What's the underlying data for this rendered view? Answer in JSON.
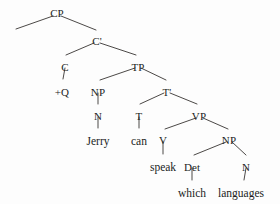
{
  "figure": {
    "kind": "syntax-tree",
    "background_color": "#fdfdfd",
    "ink_color": "#231f1e",
    "width": 280,
    "height": 204
  },
  "nodes": [
    {
      "id": "cp",
      "label": "CP",
      "x": 57,
      "y": 8,
      "type": "nonterminal"
    },
    {
      "id": "spec-cp",
      "label": "",
      "x": 16,
      "y": 29,
      "type": "empty-specifier"
    },
    {
      "id": "cbar",
      "label": "C'",
      "x": 97,
      "y": 36,
      "type": "nonterminal"
    },
    {
      "id": "c",
      "label": "C",
      "x": 65,
      "y": 62,
      "type": "nonterminal"
    },
    {
      "id": "q",
      "label": "+Q",
      "x": 62,
      "y": 87,
      "type": "feature"
    },
    {
      "id": "tp",
      "label": "TP",
      "x": 138,
      "y": 62,
      "type": "nonterminal"
    },
    {
      "id": "np-subj",
      "label": "NP",
      "x": 98,
      "y": 87,
      "type": "nonterminal"
    },
    {
      "id": "n-subj",
      "label": "N",
      "x": 98,
      "y": 111,
      "type": "nonterminal"
    },
    {
      "id": "tbar",
      "label": "T'",
      "x": 167,
      "y": 87,
      "type": "nonterminal"
    },
    {
      "id": "t",
      "label": "T",
      "x": 139,
      "y": 111,
      "type": "nonterminal"
    },
    {
      "id": "vp",
      "label": "VP",
      "x": 199,
      "y": 111,
      "type": "nonterminal"
    },
    {
      "id": "v",
      "label": "V",
      "x": 163,
      "y": 135,
      "type": "nonterminal"
    },
    {
      "id": "np-obj",
      "label": "NP",
      "x": 229,
      "y": 135,
      "type": "nonterminal"
    },
    {
      "id": "det",
      "label": "Det",
      "x": 192,
      "y": 162,
      "type": "nonterminal"
    },
    {
      "id": "n-obj",
      "label": "N",
      "x": 246,
      "y": 162,
      "type": "nonterminal"
    }
  ],
  "terminals": [
    {
      "id": "jerry",
      "label": "Jerry",
      "x": 98,
      "y": 136
    },
    {
      "id": "can",
      "label": "can",
      "x": 139,
      "y": 136
    },
    {
      "id": "speak",
      "label": "speak",
      "x": 163,
      "y": 162
    },
    {
      "id": "which",
      "label": "which",
      "x": 192,
      "y": 188
    },
    {
      "id": "languages",
      "label": "languages",
      "x": 241,
      "y": 188
    }
  ],
  "edges": [
    {
      "id": "cp-spec",
      "from": "cp",
      "to": "spec-cp",
      "x1": 53,
      "y1": 16,
      "x2": 16,
      "y2": 29
    },
    {
      "id": "cp-cbar",
      "from": "cp",
      "to": "cbar",
      "x1": 61,
      "y1": 16,
      "x2": 96,
      "y2": 30
    },
    {
      "id": "cbar-c",
      "from": "cbar",
      "to": "c",
      "x1": 94,
      "y1": 43,
      "x2": 66,
      "y2": 55
    },
    {
      "id": "cbar-tp",
      "from": "cbar",
      "to": "tp",
      "x1": 100,
      "y1": 43,
      "x2": 136,
      "y2": 55
    },
    {
      "id": "c-q",
      "from": "c",
      "to": "q",
      "x1": 65,
      "y1": 68,
      "x2": 63,
      "y2": 79
    },
    {
      "id": "tp-np",
      "from": "tp",
      "to": "np-subj",
      "x1": 135,
      "y1": 68,
      "x2": 100,
      "y2": 80
    },
    {
      "id": "tp-tbar",
      "from": "tp",
      "to": "tbar",
      "x1": 141,
      "y1": 68,
      "x2": 166,
      "y2": 80
    },
    {
      "id": "np-n",
      "from": "np-subj",
      "to": "n-subj",
      "x1": 98,
      "y1": 93,
      "x2": 98,
      "y2": 104
    },
    {
      "id": "n-jerry",
      "from": "n-subj",
      "to": "jerry",
      "x1": 98,
      "y1": 117,
      "x2": 98,
      "y2": 128
    },
    {
      "id": "tbar-t",
      "from": "tbar",
      "to": "t",
      "x1": 164,
      "y1": 93,
      "x2": 140,
      "y2": 104
    },
    {
      "id": "tbar-vp",
      "from": "tbar",
      "to": "vp",
      "x1": 170,
      "y1": 93,
      "x2": 197,
      "y2": 104
    },
    {
      "id": "t-can",
      "from": "t",
      "to": "can",
      "x1": 139,
      "y1": 117,
      "x2": 139,
      "y2": 128
    },
    {
      "id": "vp-v",
      "from": "vp",
      "to": "v",
      "x1": 196,
      "y1": 118,
      "x2": 165,
      "y2": 129
    },
    {
      "id": "vp-np",
      "from": "vp",
      "to": "np-obj",
      "x1": 203,
      "y1": 118,
      "x2": 228,
      "y2": 129
    },
    {
      "id": "v-speak",
      "from": "v",
      "to": "speak",
      "x1": 163,
      "y1": 141,
      "x2": 163,
      "y2": 154
    },
    {
      "id": "np-det",
      "from": "np-obj",
      "to": "det",
      "x1": 226,
      "y1": 142,
      "x2": 194,
      "y2": 155
    },
    {
      "id": "np-nobj",
      "from": "np-obj",
      "to": "n-obj",
      "x1": 232,
      "y1": 142,
      "x2": 246,
      "y2": 155
    },
    {
      "id": "det-which",
      "from": "det",
      "to": "which",
      "x1": 192,
      "y1": 168,
      "x2": 192,
      "y2": 180
    },
    {
      "id": "nobj-langs",
      "from": "n-obj",
      "to": "languages",
      "x1": 246,
      "y1": 168,
      "x2": 244,
      "y2": 180
    }
  ],
  "sentence": "which languages can Jerry speak"
}
